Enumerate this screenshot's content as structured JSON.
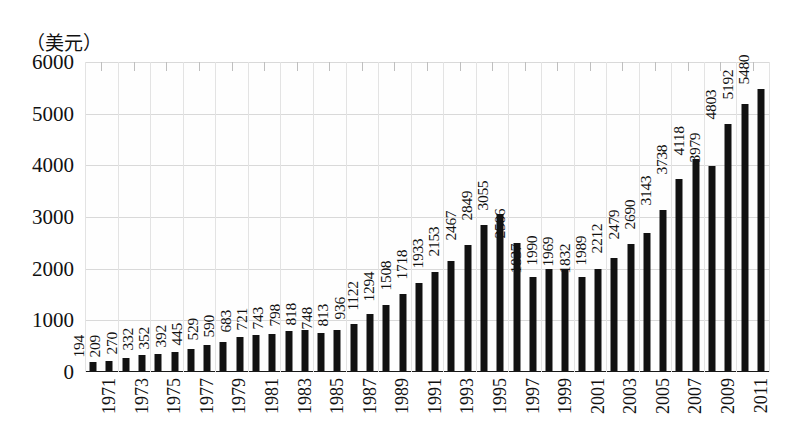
{
  "chart_data": {
    "type": "bar",
    "title": "",
    "subtitle": "",
    "unit_caption": "（美元）",
    "xlabel": "",
    "ylabel": "",
    "ylim": [
      0,
      6000
    ],
    "y_ticks": [
      0,
      1000,
      2000,
      3000,
      4000,
      5000,
      6000
    ],
    "y_tick_labels": [
      "0",
      "1000",
      "2000",
      "3000",
      "4000",
      "5000",
      "6000"
    ],
    "grid": true,
    "legend": null,
    "x_tick_labels": [
      "1971",
      "1973",
      "1975",
      "1977",
      "1979",
      "1981",
      "1983",
      "1985",
      "1987",
      "1989",
      "1991",
      "1993",
      "1995",
      "1997",
      "1999",
      "2001",
      "2003",
      "2005",
      "2007",
      "2009",
      "2011"
    ],
    "x_tick_step": 2,
    "categories": [
      "1971",
      "1972",
      "1973",
      "1974",
      "1975",
      "1976",
      "1977",
      "1978",
      "1979",
      "1980",
      "1981",
      "1982",
      "1983",
      "1984",
      "1985",
      "1986",
      "1987",
      "1988",
      "1989",
      "1990",
      "1991",
      "1992",
      "1993",
      "1994",
      "1995",
      "1996",
      "1997",
      "1998",
      "1999",
      "2000",
      "2001",
      "2002",
      "2003",
      "2004",
      "2005",
      "2006",
      "2007",
      "2008",
      "2009",
      "2010",
      "2011",
      "2012"
    ],
    "values": [
      194,
      209,
      270,
      332,
      352,
      392,
      445,
      529,
      590,
      683,
      721,
      743,
      798,
      818,
      748,
      813,
      936,
      1122,
      1294,
      1508,
      1718,
      1933,
      2153,
      2467,
      2849,
      3055,
      2506,
      1837,
      1990,
      1969,
      1832,
      1989,
      2212,
      2479,
      2690,
      3143,
      3738,
      4118,
      3979,
      4803,
      5192,
      5480
    ],
    "bar_color": "#121212",
    "show_value_labels": true,
    "value_label_orientation": "vertical"
  }
}
